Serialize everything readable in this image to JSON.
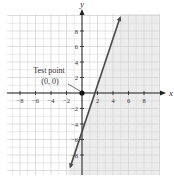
{
  "chart_data": {
    "type": "line",
    "title": "",
    "xlabel": "x",
    "ylabel": "y",
    "xlim": [
      -9.7,
      10
    ],
    "ylim": [
      -10.5,
      10.5
    ],
    "grid": true,
    "x_ticks": [
      -8,
      -6,
      -4,
      -2,
      2,
      4,
      6,
      8
    ],
    "y_ticks": [
      8,
      6,
      4,
      2,
      -2,
      -4,
      -6,
      -8
    ],
    "series": [
      {
        "name": "boundary line y = 3x - 5",
        "x": [
          -1.5,
          4.9
        ],
        "y": [
          -9.5,
          9.7
        ],
        "style": "solid"
      }
    ],
    "shaded_region": "right of line (y < 3x - 5)",
    "annotations": [
      {
        "text": "Test point",
        "line2": "(0, 0)",
        "point": [
          0,
          0
        ]
      }
    ]
  },
  "labels": {
    "x_axis": "x",
    "y_axis": "y",
    "annotation_line1": "Test point",
    "annotation_line2": "(0, 0)"
  },
  "colors": {
    "grid": "#d4d4d4",
    "axis": "#222222",
    "line": "#4a4a4a",
    "shade": "#ececec"
  }
}
